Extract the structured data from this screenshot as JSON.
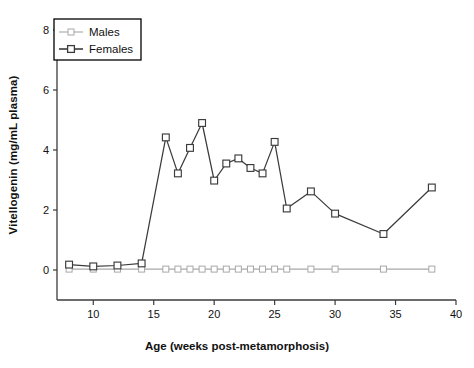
{
  "chart_data": {
    "type": "line",
    "title": "",
    "xlabel": "Age (weeks post-metamorphosis)",
    "ylabel": "Vitellogenin (mg/mL plasma)",
    "xlim": [
      7,
      40
    ],
    "ylim": [
      -1,
      8
    ],
    "grid": false,
    "legend_position": "top-left",
    "xticks": [
      10,
      15,
      20,
      25,
      30,
      35,
      40
    ],
    "xtick_labels": [
      "10",
      "15",
      "20",
      "25",
      "30",
      "35",
      "40"
    ],
    "yticks": [
      0,
      2,
      4,
      6,
      8
    ],
    "ytick_labels": [
      "0",
      "2",
      "4",
      "6",
      "8"
    ],
    "series": [
      {
        "name": "Males",
        "color": "#a8a8a8",
        "marker": "open-square",
        "x": [
          8,
          10,
          12,
          14,
          16,
          17,
          18,
          19,
          20,
          21,
          22,
          23,
          24,
          25,
          26,
          28,
          30,
          34,
          38
        ],
        "values": [
          0.03,
          0.03,
          0.03,
          0.03,
          0.03,
          0.03,
          0.03,
          0.03,
          0.03,
          0.03,
          0.03,
          0.03,
          0.03,
          0.03,
          0.03,
          0.03,
          0.03,
          0.03,
          0.03
        ]
      },
      {
        "name": "Females",
        "color": "#3b3b3b",
        "marker": "open-square",
        "x": [
          8,
          10,
          12,
          14,
          16,
          17,
          18,
          19,
          20,
          21,
          22,
          23,
          24,
          25,
          26,
          28,
          30,
          34,
          38
        ],
        "values": [
          0.18,
          0.12,
          0.15,
          0.22,
          4.42,
          3.22,
          4.07,
          4.9,
          2.98,
          3.55,
          3.72,
          3.4,
          3.22,
          4.27,
          2.05,
          2.62,
          1.88,
          1.2,
          2.75
        ]
      }
    ]
  },
  "legend": {
    "entries": [
      {
        "label": "Males"
      },
      {
        "label": "Females"
      }
    ]
  },
  "axes": {
    "x_title": "Age (weeks post-metamorphosis)",
    "y_title": "Vitellogenin (mg/mL plasma)"
  }
}
